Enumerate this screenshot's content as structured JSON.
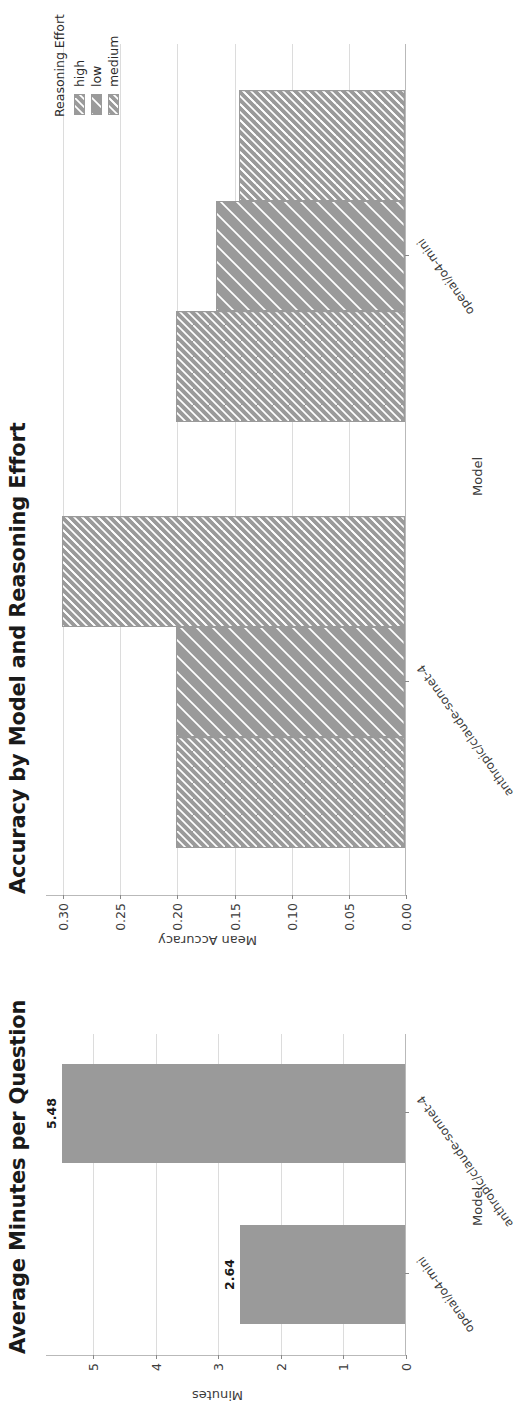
{
  "figure": {
    "background": "#ffffff",
    "bar_color": "#9a9a9a",
    "hatch_color": "#ffffff",
    "grid_color": "#dcdcdc",
    "axis_color": "#b9b9b9"
  },
  "chart_data": [
    {
      "type": "bar",
      "id": "accuracy-by-model-and-reasoning-effort",
      "title": "Accuracy by Model and Reasoning Effort",
      "xlabel": "Model",
      "ylabel": "Mean Accuracy",
      "categories": [
        "anthropic/claude-sonnet-4",
        "openai/o4-mini"
      ],
      "ylim": [
        0.0,
        0.315
      ],
      "yticks": [
        "0.00",
        "0.05",
        "0.10",
        "0.15",
        "0.20",
        "0.25",
        "0.30"
      ],
      "ytick_values": [
        0.0,
        0.05,
        0.1,
        0.15,
        0.2,
        0.25,
        0.3
      ],
      "grid": true,
      "grid_axis": "y",
      "legend": {
        "title": "Reasoning Effort",
        "position": "upper right",
        "entries": [
          {
            "label": "high",
            "hatch": "//"
          },
          {
            "label": "low",
            "hatch": "\\\\"
          },
          {
            "label": "medium",
            "hatch": "xx"
          }
        ]
      },
      "series": [
        {
          "name": "high",
          "hatch": "//",
          "values": [
            0.2,
            0.2
          ]
        },
        {
          "name": "low",
          "hatch": "\\\\",
          "values": [
            0.2,
            0.165
          ]
        },
        {
          "name": "medium",
          "hatch": "xx",
          "values": [
            0.3,
            0.145
          ]
        }
      ]
    },
    {
      "type": "bar",
      "id": "average-minutes-per-question",
      "title": "Average Minutes per Question",
      "xlabel": "Model",
      "ylabel": "Minutes",
      "categories": [
        "openai/o4-mini",
        "anthropic/claude-sonnet-4"
      ],
      "ylim": [
        0.0,
        5.75
      ],
      "yticks": [
        "0",
        "1",
        "2",
        "3",
        "4",
        "5"
      ],
      "ytick_values": [
        0,
        1,
        2,
        3,
        4,
        5
      ],
      "grid": true,
      "grid_axis": "y",
      "values": [
        2.64,
        5.48
      ],
      "value_labels": [
        "2.64",
        "5.48"
      ]
    }
  ]
}
